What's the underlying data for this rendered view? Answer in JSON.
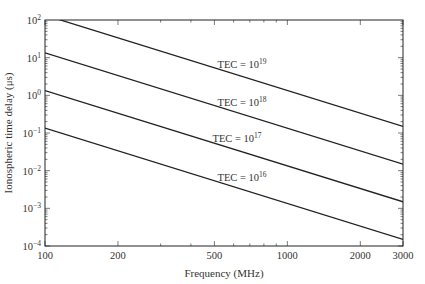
{
  "chart_data": {
    "type": "line",
    "title": "",
    "xlabel": "Frequency (MHz)",
    "ylabel": "Ionospheric time delay (μs)",
    "xscale": "log",
    "yscale": "log",
    "xlim": [
      100,
      3000
    ],
    "ylim": [
      0.0001,
      100
    ],
    "x_ticks": [
      100,
      200,
      500,
      1000,
      2000,
      3000
    ],
    "x_tick_labels": [
      "100",
      "200",
      "500",
      "1000",
      "2000",
      "3000"
    ],
    "y_tick_exponents": [
      2,
      1,
      0,
      -1,
      -2,
      -3,
      -4
    ],
    "grid": false,
    "legend": "none",
    "x": [
      100,
      3000
    ],
    "series": [
      {
        "name": "TEC = 10^19",
        "label_base": "TEC = 10",
        "label_exp": "19",
        "values": [
          134.3,
          0.1493
        ]
      },
      {
        "name": "TEC = 10^18",
        "label_base": "TEC = 10",
        "label_exp": "18",
        "values": [
          13.43,
          0.01493
        ]
      },
      {
        "name": "TEC = 10^17",
        "label_base": "TEC = 10",
        "label_exp": "17",
        "values": [
          1.343,
          0.001493
        ]
      },
      {
        "name": "TEC = 10^16",
        "label_base": "TEC = 10",
        "label_exp": "16",
        "values": [
          0.1343,
          0.0001493
        ]
      }
    ],
    "annotation_freq": [
      650,
      650,
      620,
      650
    ]
  }
}
